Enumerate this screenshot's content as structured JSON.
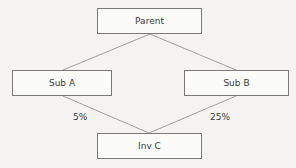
{
  "diagram": {
    "type": "ownership-structure",
    "nodes": [
      {
        "id": "parent",
        "label": "Parent",
        "x": 97,
        "y": 8,
        "w": 105,
        "h": 26
      },
      {
        "id": "sub_a",
        "label": "Sub A",
        "x": 12,
        "y": 70,
        "w": 100,
        "h": 26
      },
      {
        "id": "sub_b",
        "label": "Sub B",
        "x": 184,
        "y": 70,
        "w": 105,
        "h": 26
      },
      {
        "id": "inv_c",
        "label": "Inv C",
        "x": 97,
        "y": 133,
        "w": 105,
        "h": 26
      }
    ],
    "edges": [
      {
        "from": "parent",
        "to": "sub_a",
        "label": ""
      },
      {
        "from": "parent",
        "to": "sub_b",
        "label": ""
      },
      {
        "from": "sub_a",
        "to": "inv_c",
        "label": "5%"
      },
      {
        "from": "sub_b",
        "to": "inv_c",
        "label": "25%"
      }
    ],
    "edge_labels": {
      "sub_a_to_inv_c": "5%",
      "sub_b_to_inv_c": "25%"
    },
    "colors": {
      "line": "#8a8a8a",
      "border": "#7a7a7a",
      "text": "#3a3a3a",
      "background": "#f4f3f1"
    }
  }
}
